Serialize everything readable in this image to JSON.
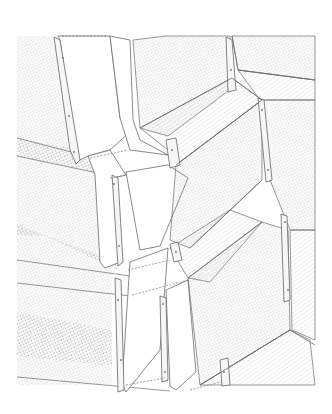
{
  "drawing": {
    "kind": "architectural facade detail (zig-zag folded panels with angle brackets)",
    "colors": {
      "background": "#ffffff",
      "line": "#6b6b6b",
      "hatch": "#b8b8b8",
      "hatch_dense": "#a6a6a6",
      "bracket_fill": "#f4f4f4"
    }
  }
}
